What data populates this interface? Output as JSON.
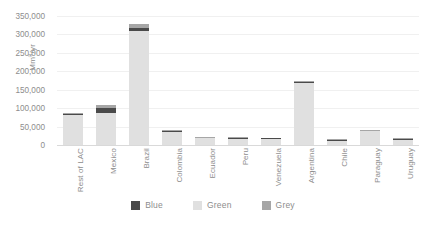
{
  "chart_data": {
    "type": "bar",
    "stacked": true,
    "title": "",
    "xlabel": "",
    "ylabel": "Mm3/yr",
    "ylim": [
      0,
      350000
    ],
    "ytick_labels": [
      "350,000",
      "300,000",
      "250,000",
      "200,000",
      "150,000",
      "100,000",
      "50,000",
      "0"
    ],
    "ytick_values": [
      350000,
      300000,
      250000,
      200000,
      150000,
      100000,
      50000,
      0
    ],
    "grid": true,
    "legend_position": "bottom",
    "categories": [
      "Rest of LAC",
      "Mexico",
      "Brazil",
      "Colombia",
      "Ecuador",
      "Peru",
      "Venezuela",
      "Argentina",
      "Chile",
      "Paraguay",
      "Uruguay"
    ],
    "series": [
      {
        "name": "Green",
        "color": "#e0e0e0",
        "values": [
          82000,
          88000,
          308000,
          36000,
          18000,
          17000,
          16000,
          168000,
          11000,
          37000,
          14000
        ]
      },
      {
        "name": "Blue",
        "color": "#4a4a4a",
        "values": [
          3000,
          12000,
          9000,
          1500,
          1200,
          1500,
          1000,
          4000,
          2500,
          1200,
          1500
        ]
      },
      {
        "name": "Grey",
        "color": "#a6a6a6",
        "values": [
          3000,
          8000,
          11000,
          2500,
          1300,
          1500,
          1200,
          2000,
          1000,
          2000,
          1000
        ]
      }
    ],
    "legend": [
      {
        "label": "Blue",
        "color": "#4a4a4a"
      },
      {
        "label": "Green",
        "color": "#e0e0e0"
      },
      {
        "label": "Grey",
        "color": "#a6a6a6"
      }
    ]
  },
  "axis": {
    "y_title_main": "Mm",
    "y_title_sup": "3",
    "y_title_unit": "/yr"
  }
}
